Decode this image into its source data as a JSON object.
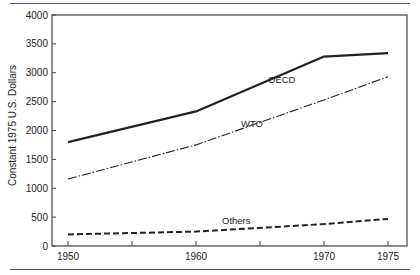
{
  "chart_data": {
    "type": "line",
    "title": "",
    "xlabel": "",
    "ylabel": "Constant 1975 U.S. Dollars",
    "x": [
      1950,
      1960,
      1970,
      1975
    ],
    "x_tick_labels": [
      "1950",
      "1960",
      "1970",
      "1975"
    ],
    "x_minor_ticks": [
      1955,
      1965
    ],
    "y_tick_labels": [
      "0",
      "500",
      "1000",
      "1500",
      "2000",
      "2500",
      "3000",
      "3500",
      "4000"
    ],
    "ylim": [
      0,
      4000
    ],
    "grid": false,
    "legend": "inline labels",
    "series": [
      {
        "name": "OECD",
        "style": "solid-thick",
        "values": [
          1800,
          2330,
          3280,
          3340
        ]
      },
      {
        "name": "WTO",
        "style": "dash-dot",
        "values": [
          1160,
          1750,
          2530,
          2930
        ]
      },
      {
        "name": "Others",
        "style": "dashed-thick",
        "values": [
          200,
          250,
          380,
          470
        ]
      }
    ]
  },
  "labels": {
    "oecd": "OECD",
    "wto": "WTO",
    "others": "Others",
    "ylabel": "Constant 1975 U.S. Dollars"
  },
  "colors": {
    "line": "#222222",
    "axis": "#444444"
  }
}
